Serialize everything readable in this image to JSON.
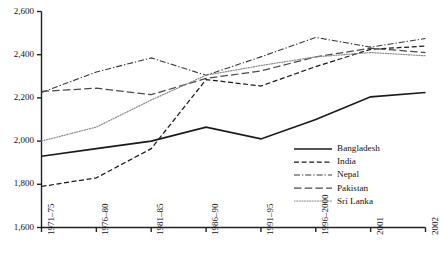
{
  "chart_data": {
    "type": "line",
    "title": "",
    "subtitle": "",
    "xlabel": "",
    "ylabel": "",
    "categories": [
      "1971–75",
      "1976–80",
      "1981–85",
      "1986–90",
      "1991–95",
      "1996–2000",
      "2001",
      "2002"
    ],
    "ylim": [
      1600,
      2600
    ],
    "yticks": [
      1600,
      1800,
      2000,
      2200,
      2400,
      2600
    ],
    "ytick_labels": [
      "1,600",
      "1,800",
      "2,000",
      "2,200",
      "2,400",
      "2,600"
    ],
    "grid": false,
    "legend_position": "inside-bottom-right",
    "series": [
      {
        "name": "Bangladesh",
        "style": "solid",
        "color": "#1a1a1a",
        "values": [
          1930,
          1965,
          2000,
          2065,
          2010,
          2100,
          2205,
          2225
        ]
      },
      {
        "name": "India",
        "style": "dashed",
        "color": "#1a1a1a",
        "values": [
          1790,
          1830,
          1965,
          2285,
          2255,
          2345,
          2425,
          2440
        ]
      },
      {
        "name": "Nepal",
        "style": "dash-dot",
        "color": "#3a3a3a",
        "values": [
          2225,
          2320,
          2385,
          2305,
          2390,
          2480,
          2435,
          2475
        ]
      },
      {
        "name": "Pakistan",
        "style": "long-dash",
        "color": "#4a4a4a",
        "values": [
          2230,
          2245,
          2215,
          2290,
          2325,
          2390,
          2430,
          2410
        ]
      },
      {
        "name": "Sri Lanka",
        "style": "dotted",
        "color": "#8a8a8a",
        "values": [
          2000,
          2065,
          2190,
          2305,
          2350,
          2390,
          2410,
          2395
        ]
      }
    ]
  },
  "legend": {
    "items": [
      {
        "label": "Bangladesh"
      },
      {
        "label": "India"
      },
      {
        "label": "Nepal"
      },
      {
        "label": "Pakistan"
      },
      {
        "label": "Sri Lanka"
      }
    ]
  },
  "axes": {
    "y_labels": [
      "2,600",
      "2,400",
      "2,200",
      "2,000",
      "1,800",
      "1,600"
    ],
    "x_labels": [
      "1971–75",
      "1976–80",
      "1981–85",
      "1986–90",
      "1991–95",
      "1996–2000",
      "2001",
      "2002"
    ]
  }
}
